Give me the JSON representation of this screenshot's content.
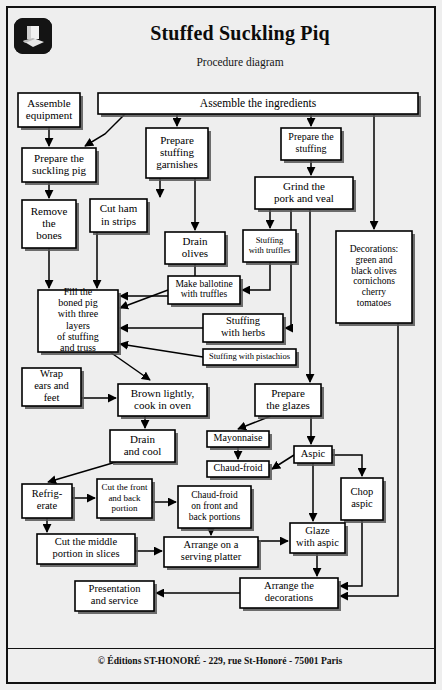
{
  "document": {
    "title": "Stuffed Suckling Piq",
    "subtitle": "Procedure diagram",
    "logo_icon": "chef-hat-icon",
    "footer": "© Éditions ST-HONORÉ - 229, rue St-Honoré - 75001 Paris",
    "background_color": "#eeeeee",
    "border_color": "#111111",
    "node_fill": "#ffffff"
  },
  "chart_data": {
    "type": "diagram",
    "title": "Stuffed Suckling Piq",
    "subtitle": "Procedure diagram",
    "orientation": "top-to-bottom",
    "nodes": [
      {
        "id": "assemble_equipment",
        "label": "Assemble\nequipment",
        "x": 18,
        "y": 93,
        "w": 62,
        "h": 34,
        "fs": 11
      },
      {
        "id": "assemble_ingredients",
        "label": "Assemble the ingredients",
        "x": 98,
        "y": 93,
        "w": 320,
        "h": 21,
        "fs": 11.5
      },
      {
        "id": "prepare_pig",
        "label": "Prepare the\nsuckling pig",
        "x": 22,
        "y": 148,
        "w": 74,
        "h": 34,
        "fs": 11
      },
      {
        "id": "prepare_garnishes",
        "label": "Prepare\nstuffing\ngarnishes",
        "x": 146,
        "y": 128,
        "w": 62,
        "h": 50,
        "fs": 11
      },
      {
        "id": "prepare_stuffing",
        "label": "Prepare the\nstuffing",
        "x": 281,
        "y": 128,
        "w": 60,
        "h": 32,
        "fs": 10
      },
      {
        "id": "remove_bones",
        "label": "Remove\nthe\nbones",
        "x": 22,
        "y": 200,
        "w": 54,
        "h": 48,
        "fs": 11
      },
      {
        "id": "cut_ham",
        "label": "Cut ham\nin strips",
        "x": 90,
        "y": 199,
        "w": 57,
        "h": 33,
        "fs": 11
      },
      {
        "id": "grind_pork",
        "label": "Grind the\npork and veal",
        "x": 255,
        "y": 177,
        "w": 98,
        "h": 32,
        "fs": 11
      },
      {
        "id": "drain_olives",
        "label": "Drain\nolives",
        "x": 165,
        "y": 232,
        "w": 60,
        "h": 32,
        "fs": 11
      },
      {
        "id": "stuffing_truffles",
        "label": "Stuffing\nwith truffles",
        "x": 243,
        "y": 230,
        "w": 53,
        "h": 32,
        "fs": 8.5
      },
      {
        "id": "decorations",
        "label": "Decorations:\ngreen and\nblack olives\ncornichons\ncherry\ntomatoes",
        "x": 336,
        "y": 231,
        "w": 76,
        "h": 92,
        "fs": 9.5
      },
      {
        "id": "fill_boned_pig",
        "label": "Fill the\nboned pig\nwith three\nlayers\nof stuffing\nand truss",
        "x": 38,
        "y": 290,
        "w": 80,
        "h": 62,
        "fs": 10
      },
      {
        "id": "make_ballotine",
        "label": "Make ballotine\nwith truffles",
        "x": 168,
        "y": 276,
        "w": 72,
        "h": 28,
        "fs": 9.5
      },
      {
        "id": "stuffing_herbs",
        "label": "Stuffing\nwith herbs",
        "x": 203,
        "y": 314,
        "w": 80,
        "h": 28,
        "fs": 10.5
      },
      {
        "id": "stuffing_pistachios",
        "label": "Stuffing with pistachios",
        "x": 203,
        "y": 349,
        "w": 93,
        "h": 16,
        "fs": 8.5
      },
      {
        "id": "wrap_ears",
        "label": "Wrap\nears and\nfeet",
        "x": 22,
        "y": 368,
        "w": 59,
        "h": 38,
        "fs": 10.5
      },
      {
        "id": "brown_lightly",
        "label": "Brown lightly,\ncook in oven",
        "x": 118,
        "y": 384,
        "w": 89,
        "h": 32,
        "fs": 11
      },
      {
        "id": "prepare_glazes",
        "label": "Prepare\nthe glazes",
        "x": 255,
        "y": 384,
        "w": 66,
        "h": 32,
        "fs": 11
      },
      {
        "id": "drain_cool",
        "label": "Drain\nand cool",
        "x": 110,
        "y": 430,
        "w": 65,
        "h": 32,
        "fs": 11
      },
      {
        "id": "mayonnaise",
        "label": "Mayonnaise",
        "x": 207,
        "y": 431,
        "w": 62,
        "h": 16,
        "fs": 10
      },
      {
        "id": "aspic",
        "label": "Aspic",
        "x": 294,
        "y": 446,
        "w": 38,
        "h": 17,
        "fs": 10.5
      },
      {
        "id": "chaud_froid",
        "label": "Chaud-froid",
        "x": 207,
        "y": 461,
        "w": 62,
        "h": 16,
        "fs": 10
      },
      {
        "id": "refrigerate",
        "label": "Refrig-\nerate",
        "x": 22,
        "y": 484,
        "w": 50,
        "h": 34,
        "fs": 10.5
      },
      {
        "id": "cut_front_back",
        "label": "Cut the front\nand back\nportion",
        "x": 97,
        "y": 479,
        "w": 55,
        "h": 39,
        "fs": 9
      },
      {
        "id": "chaud_froid_portions",
        "label": "Chaud-froid\non front and\nback portions",
        "x": 178,
        "y": 486,
        "w": 73,
        "h": 42,
        "fs": 9.5
      },
      {
        "id": "chop_aspic",
        "label": "Chop\naspic",
        "x": 341,
        "y": 478,
        "w": 42,
        "h": 42,
        "fs": 10.5
      },
      {
        "id": "cut_middle",
        "label": "Cut the middle\nportion in slices",
        "x": 37,
        "y": 534,
        "w": 98,
        "h": 30,
        "fs": 10.5
      },
      {
        "id": "arrange_platter",
        "label": "Arrange on a\nserving platter",
        "x": 164,
        "y": 537,
        "w": 94,
        "h": 30,
        "fs": 10.5
      },
      {
        "id": "glaze_aspic",
        "label": "Glaze\nwith aspic",
        "x": 290,
        "y": 523,
        "w": 55,
        "h": 30,
        "fs": 10.5
      },
      {
        "id": "arrange_decorations",
        "label": "Arrange the\ndecorations",
        "x": 240,
        "y": 578,
        "w": 98,
        "h": 30,
        "fs": 10.5
      },
      {
        "id": "presentation",
        "label": "Presentation\nand service",
        "x": 75,
        "y": 581,
        "w": 79,
        "h": 30,
        "fs": 10.5
      }
    ],
    "edges": [
      {
        "from": "assemble_ingredients",
        "to": "prepare_pig",
        "points": "125,114 105,134 85,146"
      },
      {
        "from": "assemble_ingredients",
        "to": "prepare_garnishes",
        "points": "177,114 177,126"
      },
      {
        "from": "assemble_ingredients",
        "to": "prepare_stuffing",
        "points": "311,114 311,126"
      },
      {
        "from": "assemble_ingredients",
        "to": "decorations",
        "points": "374,114 374,229"
      },
      {
        "from": "assemble_equipment",
        "to": "prepare_pig",
        "points": "49,127 49,146"
      },
      {
        "from": "prepare_pig",
        "to": "remove_bones",
        "points": "49,182 49,198"
      },
      {
        "from": "prepare_garnishes",
        "to": "cut_ham",
        "points": "160,178 160,197"
      },
      {
        "from": "prepare_garnishes",
        "to": "drain_olives",
        "points": "195,178 195,230"
      },
      {
        "from": "prepare_stuffing",
        "to": "grind_pork",
        "points": "311,160 311,175"
      },
      {
        "from": "grind_pork",
        "to": "stuffing_truffles",
        "points": "270,209 270,228"
      },
      {
        "from": "grind_pork",
        "to": "stuffing_herbs",
        "points": "291,209 291,328 285,328"
      },
      {
        "from": "grind_pork",
        "to": "prepare_glazes",
        "points": "310,209 310,382"
      },
      {
        "from": "remove_bones",
        "to": "fill_boned_pig",
        "points": "49,248 49,288"
      },
      {
        "from": "cut_ham",
        "to": "fill_boned_pig",
        "points": "97,232 97,288"
      },
      {
        "from": "drain_olives",
        "to": "fill_boned_pig",
        "points": "195,264 195,296 120,296"
      },
      {
        "from": "stuffing_truffles",
        "to": "make_ballotine",
        "points": "270,262 270,290 242,290"
      },
      {
        "from": "make_ballotine",
        "to": "fill_boned_pig",
        "points": "168,290 120,308"
      },
      {
        "from": "stuffing_herbs",
        "to": "fill_boned_pig",
        "points": "203,328 120,328"
      },
      {
        "from": "stuffing_pistachios",
        "to": "fill_boned_pig",
        "points": "203,357 120,344"
      },
      {
        "from": "fill_boned_pig",
        "to": "brown_lightly",
        "points": "110,352 150,380"
      },
      {
        "from": "wrap_ears",
        "to": "brown_lightly",
        "points": "81,398 116,398"
      },
      {
        "from": "brown_lightly",
        "to": "drain_cool",
        "points": "145,416 145,428"
      },
      {
        "from": "drain_cool",
        "to": "refrigerate",
        "points": "116,462 48,482"
      },
      {
        "from": "prepare_glazes",
        "to": "mayonnaise",
        "points": "271,416 238,429"
      },
      {
        "from": "prepare_glazes",
        "to": "aspic",
        "points": "311,416 311,444"
      },
      {
        "from": "mayonnaise",
        "to": "chaud_froid",
        "points": "238,447 238,459"
      },
      {
        "from": "aspic",
        "to": "chaud_froid",
        "points": "294,455 272,469"
      },
      {
        "from": "aspic",
        "to": "chop_aspic",
        "points": "332,455 362,455 362,476"
      },
      {
        "from": "aspic",
        "to": "glaze_aspic",
        "points": "313,463 313,521"
      },
      {
        "from": "refrigerate",
        "to": "cut_front_back",
        "points": "72,498 95,498"
      },
      {
        "from": "refrigerate",
        "to": "cut_middle",
        "points": "47,518 47,532"
      },
      {
        "from": "cut_front_back",
        "to": "chaud_froid_portions",
        "points": "152,502 176,502"
      },
      {
        "from": "chaud_froid_portions",
        "to": "arrange_platter",
        "points": "211,528 211,535"
      },
      {
        "from": "cut_middle",
        "to": "arrange_platter",
        "points": "135,551 162,551"
      },
      {
        "from": "arrange_platter",
        "to": "glaze_aspic",
        "points": "258,541 288,541"
      },
      {
        "from": "glaze_aspic",
        "to": "arrange_decorations",
        "points": "317,553 317,576"
      },
      {
        "from": "chop_aspic",
        "to": "arrange_decorations",
        "points": "362,520 362,586 340,586"
      },
      {
        "from": "chop_aspic",
        "to": "arrange_decorations_2",
        "points": "398,323 398,596 340,596"
      },
      {
        "from": "arrange_decorations",
        "to": "presentation",
        "points": "240,593 156,593"
      }
    ]
  }
}
